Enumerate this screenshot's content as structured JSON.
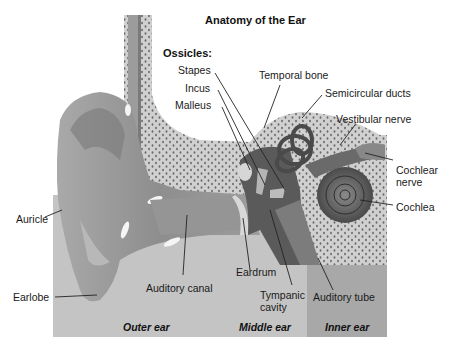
{
  "title": "Anatomy of the Ear",
  "ossicles_heading": "Ossicles:",
  "labels": {
    "stapes": "Stapes",
    "incus": "Incus",
    "malleus": "Malleus",
    "temporal_bone": "Temporal bone",
    "semicircular_ducts": "Semicircular ducts",
    "vestibular_nerve": "Vestibular nerve",
    "cochlear_nerve_1": "Cochlear",
    "cochlear_nerve_2": "nerve",
    "cochlea": "Cochlea",
    "auricle": "Auricle",
    "earlobe": "Earlobe",
    "auditory_canal": "Auditory canal",
    "eardrum": "Eardrum",
    "tympanic_cavity_1": "Tympanic",
    "tympanic_cavity_2": "cavity",
    "auditory_tube": "Auditory tube"
  },
  "sections": {
    "outer": "Outer ear",
    "middle": "Middle ear",
    "inner": "Inner ear"
  },
  "colors": {
    "panel": "#c4c4c4",
    "inner_panel": "#a8a8a8",
    "bone": "#d2d2d2",
    "skin": "#9a9a9a",
    "dark_tissue": "#555555"
  }
}
